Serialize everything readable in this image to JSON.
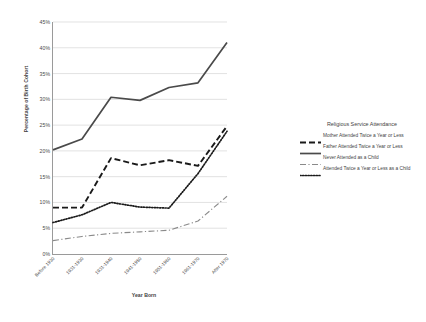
{
  "chart_data": {
    "type": "line",
    "title": "",
    "xlabel": "Year Born",
    "ylabel": "Percentage of Birth Cohort",
    "categories": [
      "Before 1930",
      "1931-1930",
      "1931-1940",
      "1941-1950",
      "1951-1960",
      "1961-1970",
      "After 1970"
    ],
    "ylim": [
      0,
      45
    ],
    "ytick_labels": [
      "0%",
      "5%",
      "10%",
      "15%",
      "20%",
      "25%",
      "30%",
      "35%",
      "40%",
      "45%"
    ],
    "ytick_values": [
      0,
      5,
      10,
      15,
      20,
      25,
      30,
      35,
      40,
      45
    ],
    "grid": true,
    "legend_position": "right",
    "legend_title": "Religious Service Attendance",
    "series": [
      {
        "name": "Mother Attended Twice a Year or Less",
        "style": "dashed",
        "color": "#1a1a1a",
        "values": [
          9.0,
          9.0,
          18.6,
          17.2,
          18.2,
          17.1,
          24.8
        ]
      },
      {
        "name": "Father Attended Twice a Year or Less",
        "style": "solid",
        "color": "#4a4a4a",
        "values": [
          20.2,
          22.3,
          30.4,
          29.8,
          32.3,
          33.2,
          41.0
        ]
      },
      {
        "name": "Never Attended as a Child",
        "style": "dashdot",
        "color": "#8a8a8a",
        "values": [
          2.6,
          3.4,
          4.0,
          4.3,
          4.6,
          6.4,
          11.2
        ]
      },
      {
        "name": "Attended Twice a Year or Less as a Child",
        "style": "dotted",
        "color": "#1a1a1a",
        "values": [
          6.1,
          7.6,
          10.0,
          9.1,
          8.9,
          15.6,
          23.8
        ]
      }
    ]
  }
}
